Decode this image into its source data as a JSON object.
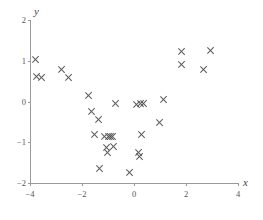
{
  "chart_data": {
    "type": "scatter",
    "title": "",
    "subtitle": "",
    "xlabel": "x",
    "ylabel": "y",
    "xlim": [
      -4,
      4
    ],
    "ylim": [
      -2,
      2
    ],
    "xticks": [
      -4,
      -2,
      0,
      2,
      4
    ],
    "yticks": [
      -2,
      -1,
      0,
      1,
      2
    ],
    "xtick_labels": [
      "-4",
      "-2",
      "0",
      "2",
      "4"
    ],
    "ytick_labels": [
      "-2",
      "-1",
      "0",
      "1",
      "2"
    ],
    "grid": false,
    "legend": null,
    "marker": "x-cross",
    "marker_color": "#5a5a5a",
    "axis_color": "#9a9a9a",
    "series": [
      {
        "name": "observations",
        "points": [
          [
            -3.77,
            1.04
          ],
          [
            -3.73,
            0.62
          ],
          [
            -3.54,
            0.6
          ],
          [
            -2.77,
            0.78
          ],
          [
            -2.5,
            0.58
          ],
          [
            -1.73,
            0.14
          ],
          [
            -1.62,
            -0.24
          ],
          [
            -1.35,
            -0.45
          ],
          [
            -1.5,
            -0.81
          ],
          [
            -1.12,
            -0.85
          ],
          [
            -0.96,
            -0.85
          ],
          [
            -0.88,
            -0.85
          ],
          [
            -0.81,
            -0.85
          ],
          [
            -1.04,
            -1.12
          ],
          [
            -1.0,
            -1.25
          ],
          [
            -0.77,
            -1.1
          ],
          [
            -0.69,
            -0.04
          ],
          [
            -1.31,
            -1.65
          ],
          [
            -0.15,
            -1.75
          ],
          [
            0.12,
            -0.08
          ],
          [
            0.27,
            -0.04
          ],
          [
            0.38,
            -0.06
          ],
          [
            0.31,
            -0.8
          ],
          [
            0.19,
            -1.25
          ],
          [
            0.23,
            -1.35
          ],
          [
            1.15,
            0.06
          ],
          [
            1.0,
            -0.52
          ],
          [
            1.85,
            1.23
          ],
          [
            1.85,
            0.92
          ],
          [
            2.69,
            0.78
          ],
          [
            2.96,
            1.25
          ]
        ]
      }
    ]
  },
  "axis": {
    "x_title": "x",
    "y_title": "y"
  }
}
